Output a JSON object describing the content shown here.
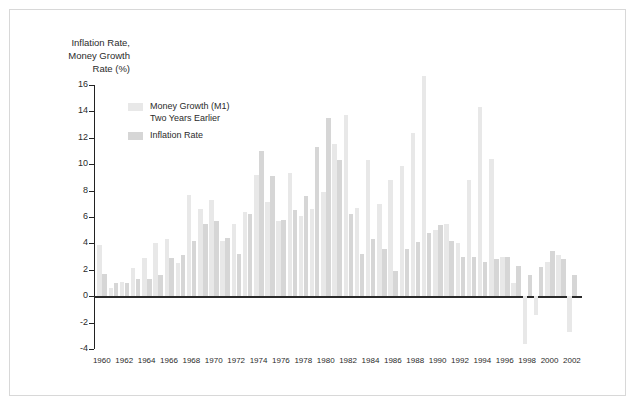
{
  "axis_title": "Inflation Rate,\nMoney Growth\nRate (%)",
  "legend": {
    "entries": [
      {
        "label": "Money Growth (M1)\nTwo Years Earlier",
        "color": "#e8e8e8",
        "name": "money-growth"
      },
      {
        "label": "Inflation Rate",
        "color": "#d6d6d6",
        "name": "inflation-rate"
      }
    ]
  },
  "colors": {
    "money_growth": "#e8e8e8",
    "inflation": "#d6d6d6",
    "axis": "#222222",
    "zero_line": "#2a2a2a",
    "frame": "#d8d8d8",
    "text": "#2b2b2b",
    "background": "#ffffff"
  },
  "chart_data": {
    "type": "bar",
    "title": "",
    "xlabel": "",
    "ylabel": "Inflation Rate, Money Growth Rate (%)",
    "ylim": [
      -4,
      16
    ],
    "yticks": [
      -4,
      -2,
      0,
      2,
      4,
      6,
      8,
      10,
      12,
      14,
      16
    ],
    "grid": false,
    "legend_position": "upper-left-inside",
    "x_tick_labels": [
      1960,
      1962,
      1964,
      1966,
      1968,
      1970,
      1972,
      1974,
      1976,
      1978,
      1980,
      1982,
      1984,
      1986,
      1988,
      1990,
      1992,
      1994,
      1996,
      1998,
      2000,
      2002
    ],
    "categories": [
      1960,
      1961,
      1962,
      1963,
      1964,
      1965,
      1966,
      1967,
      1968,
      1969,
      1970,
      1971,
      1972,
      1973,
      1974,
      1975,
      1976,
      1977,
      1978,
      1979,
      1980,
      1981,
      1982,
      1983,
      1984,
      1985,
      1986,
      1987,
      1988,
      1989,
      1990,
      1991,
      1992,
      1993,
      1994,
      1995,
      1996,
      1997,
      1998,
      1999,
      2000,
      2001,
      2002
    ],
    "series": [
      {
        "name": "Money Growth (M1) Two Years Earlier",
        "color": "#e8e8e8",
        "values": [
          3.9,
          0.6,
          1.1,
          2.1,
          2.9,
          4.0,
          4.3,
          2.5,
          7.7,
          6.6,
          7.3,
          4.2,
          5.5,
          6.4,
          9.2,
          7.1,
          5.7,
          9.3,
          6.1,
          6.6,
          7.9,
          11.5,
          13.7,
          6.7,
          10.3,
          7.0,
          8.8,
          9.9,
          12.4,
          16.7,
          5.0,
          5.5,
          4.0,
          8.8,
          14.3,
          10.4,
          3.0,
          1.0,
          -3.6,
          -1.4,
          2.6,
          3.1,
          -2.7
        ],
        "note": "M1 money growth rate lagged two years"
      },
      {
        "name": "Inflation Rate",
        "color": "#d6d6d6",
        "values": [
          1.7,
          1.0,
          1.0,
          1.3,
          1.3,
          1.6,
          2.9,
          3.1,
          4.2,
          5.5,
          5.7,
          4.4,
          3.2,
          6.2,
          11.0,
          9.1,
          5.8,
          6.5,
          7.6,
          11.3,
          13.5,
          10.3,
          6.2,
          3.2,
          4.3,
          3.6,
          1.9,
          3.6,
          4.1,
          4.8,
          5.4,
          4.2,
          3.0,
          3.0,
          2.6,
          2.8,
          3.0,
          2.3,
          1.6,
          2.2,
          3.4,
          2.8,
          1.6
        ]
      }
    ]
  }
}
